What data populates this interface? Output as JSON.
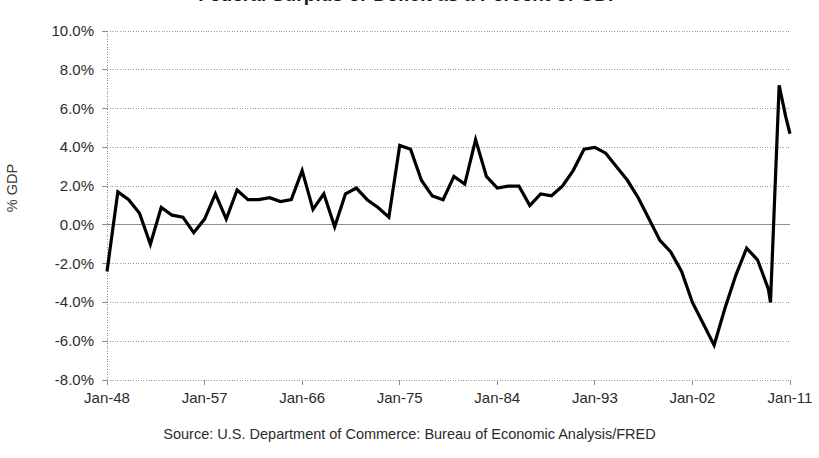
{
  "chart_data": {
    "type": "line",
    "title": "Federal Surplus or Deficit as a Percent of GDP",
    "title_cropped": true,
    "xlabel": "",
    "ylabel": "% GDP",
    "source_note": "Source: U.S. Department of Commerce: Bureau of Economic Analysis/FRED",
    "ylim": [
      -8.0,
      10.0
    ],
    "y_tick_step": 2.0,
    "y_tick_labels": [
      "10.0%",
      "8.0%",
      "6.0%",
      "4.0%",
      "2.0%",
      "0.0%",
      "-2.0%",
      "-4.0%",
      "-6.0%",
      "-8.0%"
    ],
    "y_tick_values": [
      10.0,
      8.0,
      6.0,
      4.0,
      2.0,
      0.0,
      -2.0,
      -4.0,
      -6.0,
      -8.0
    ],
    "x_tick_labels": [
      "Jan-48",
      "Jan-57",
      "Jan-66",
      "Jan-75",
      "Jan-84",
      "Jan-93",
      "Jan-02",
      "Jan-11"
    ],
    "x_tick_values": [
      1948,
      1957,
      1966,
      1975,
      1984,
      1993,
      2002,
      2011
    ],
    "xlim": [
      1948,
      2011
    ],
    "grid": "horizontal-dotted",
    "zero_line": true,
    "legend": "none",
    "series": [
      {
        "name": "Federal Surplus or Deficit as % of GDP",
        "color": "#000000",
        "line_width": 3.2,
        "x": [
          1948,
          1949,
          1950,
          1951,
          1952,
          1953,
          1954,
          1955,
          1956,
          1957,
          1958,
          1959,
          1960,
          1961,
          1962,
          1963,
          1964,
          1965,
          1966,
          1967,
          1968,
          1969,
          1970,
          1971,
          1972,
          1973,
          1974,
          1975,
          1976,
          1977,
          1978,
          1979,
          1980,
          1981,
          1982,
          1983,
          1984,
          1985,
          1986,
          1987,
          1988,
          1989,
          1990,
          1991,
          1992,
          1993,
          1994,
          1995,
          1996,
          1997,
          1998,
          1999,
          2000,
          2001,
          2002,
          2003,
          2004,
          2005,
          2006,
          2007,
          2008,
          2009,
          2010,
          2011
        ],
        "values": [
          -2.4,
          1.7,
          1.3,
          0.6,
          -1.0,
          0.9,
          0.5,
          0.4,
          -0.4,
          0.3,
          1.6,
          0.3,
          1.8,
          1.3,
          1.3,
          1.4,
          1.2,
          1.3,
          2.8,
          0.8,
          1.6,
          -0.1,
          1.6,
          1.9,
          1.3,
          0.9,
          0.4,
          4.1,
          3.9,
          2.3,
          1.5,
          1.3,
          2.5,
          2.1,
          4.4,
          2.5,
          1.9,
          2.0,
          2.0,
          1.0,
          1.6,
          1.5,
          2.0,
          2.8,
          3.9,
          4.0,
          3.7,
          3.0,
          2.3,
          1.4,
          0.3,
          -0.8,
          -1.4,
          -2.4,
          -4.0,
          -5.1,
          -6.2,
          -4.3,
          -2.6,
          -1.2,
          -1.8,
          -3.3,
          -4.0,
          -4.0
        ]
      }
    ],
    "annotations": [
      {
        "label": "series end spike",
        "x": 2010,
        "y": 7.2
      },
      {
        "label": "post-spike values",
        "values": [
          7.2,
          5.6,
          4.7
        ]
      }
    ],
    "final_spike": {
      "x": [
        2009.2,
        2010.0,
        2010.6,
        2011.0
      ],
      "values": [
        -4.0,
        7.2,
        5.6,
        4.7
      ]
    },
    "colors": {
      "line": "#000000",
      "grid": "#9a9a9a",
      "zero_line": "#8d8d8d",
      "axis": "#8d8d8d",
      "text": "#2b2b2b"
    }
  }
}
